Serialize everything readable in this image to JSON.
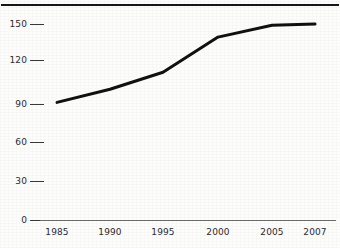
{
  "figure": {
    "caption_remnant": "",
    "background_color": "#fdfdfc",
    "rule_color": "#17171a",
    "line_color": "#111111",
    "text_color": "#2b2b2e",
    "axis_color": "#6d6d70"
  },
  "chart_data": {
    "type": "line",
    "title": "",
    "subtitle": "",
    "xlabel": "",
    "ylabel": "",
    "x": [
      1985,
      1990,
      1995,
      2000,
      2005,
      2007
    ],
    "categories": [
      "1985",
      "1990",
      "1995",
      "2000",
      "2005",
      "2007"
    ],
    "values": [
      90,
      100,
      113,
      140,
      149,
      150
    ],
    "series": [
      {
        "name": "",
        "values": [
          90,
          100,
          113,
          140,
          149,
          150
        ]
      }
    ],
    "ylim": [
      0,
      150
    ],
    "yticks": [
      0,
      30,
      60,
      90,
      120,
      150
    ],
    "ytick_labels": [
      "0",
      "30",
      "60",
      "90",
      "120",
      "150"
    ],
    "xtick_labels": [
      "1985",
      "1990",
      "1995",
      "2000",
      "2005",
      "2007"
    ],
    "grid": false,
    "legend": null,
    "legend_position": "none",
    "annotations": [],
    "line_width_px": 3,
    "marker": "none"
  },
  "geometry": {
    "x_positions": [
      57,
      110,
      163,
      218,
      272,
      315
    ],
    "y_baseline": 220,
    "y_top": 24,
    "ytick_y": [
      220,
      181,
      142,
      104,
      60,
      24
    ],
    "ytick_dash_left": 30,
    "ytick_dash_width": 14,
    "ytick_label_right": 27,
    "xlabel_y": 228
  }
}
